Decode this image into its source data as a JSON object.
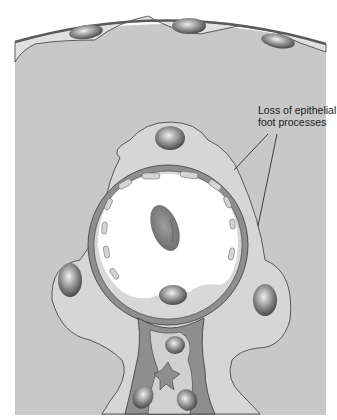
{
  "diagram": {
    "annotations": [
      {
        "id": "foot-process-loss",
        "lines": [
          "Loss of epithelial",
          "foot processes"
        ]
      }
    ],
    "colors": {
      "background": "#ffffff",
      "tissue": "#c8c8c8",
      "cell_cytoplasm": "#dadada",
      "basement_membrane": "#8e8e8e",
      "lumen": "#ffffff",
      "nucleus_dark": "#505050",
      "nucleus_light": "#e8e8e8",
      "outline": "#3a3a3a"
    },
    "structures": [
      "bowman-capsule-parietal-epithelium",
      "podocyte-nuclei",
      "capillary-lumen",
      "red-blood-cell",
      "endothelial-cell",
      "glomerular-basement-membrane",
      "mesangium"
    ]
  }
}
